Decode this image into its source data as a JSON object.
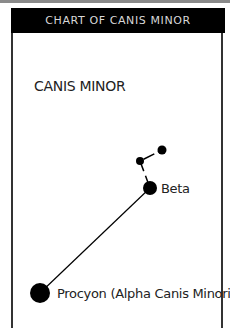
{
  "header": {
    "title": "CHART OF CANIS MINOR"
  },
  "chart": {
    "constellation_name": "CANIS MINOR",
    "stars": [
      {
        "name": "Procyon (Alpha Canis Minoris)",
        "x": 40,
        "y": 293,
        "r": 10,
        "labeled": true
      },
      {
        "name": "Beta",
        "x": 150,
        "y": 188,
        "r": 7,
        "labeled": true
      },
      {
        "name": "",
        "x": 140,
        "y": 161,
        "r": 4,
        "labeled": false
      },
      {
        "name": "",
        "x": 162,
        "y": 150,
        "r": 4.5,
        "labeled": false
      }
    ],
    "colors": {
      "header_bg": "#000000",
      "header_text": "#d8d8d8",
      "star": "#000000",
      "line": "#000000"
    }
  }
}
